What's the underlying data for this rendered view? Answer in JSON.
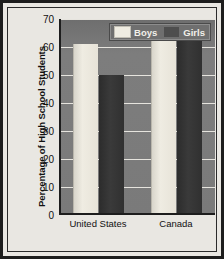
{
  "chart_data": {
    "type": "bar",
    "title": "",
    "subtitle": "",
    "xlabel": "",
    "ylabel": "Percentage of High School Students",
    "categories": [
      "United States",
      "Canada"
    ],
    "series": [
      {
        "name": "Boys",
        "values": [
          61,
          63
        ],
        "color": "#efece2"
      },
      {
        "name": "Girls",
        "values": [
          50,
          65
        ],
        "color": "#303030"
      }
    ],
    "ylim": [
      0,
      70
    ],
    "ytick_labels": [
      "0",
      "10",
      "20",
      "30",
      "40",
      "50",
      "60",
      "70"
    ],
    "ytick_values": [
      0,
      10,
      20,
      30,
      40,
      50,
      60,
      70
    ],
    "grid": true,
    "grid_color": "#e6e4de",
    "legend_position": "top-right",
    "plot_background": "#7b7b7b",
    "figure_background": "#e9e7e2",
    "border_color": "#1d1d1d"
  },
  "legend": {
    "entries": [
      {
        "label": "Boys",
        "swatch": "legend-swatch-boys"
      },
      {
        "label": "Girls",
        "swatch": "legend-swatch-girls"
      }
    ]
  }
}
